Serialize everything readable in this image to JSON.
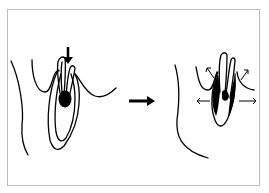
{
  "diagram": {
    "colors": {
      "stroke": "#000000",
      "fill_dark": "#000000",
      "background": "#ffffff",
      "frame": "#bdbdbd"
    },
    "panels": [
      {
        "id": "before",
        "force_arrow": "down",
        "dark_region": "apical lesion"
      },
      {
        "id": "after",
        "expansion_arrows": [
          "up-left",
          "up-right",
          "left",
          "right"
        ],
        "dark_region": "widened periodontal space"
      }
    ],
    "transition_arrow": "right"
  }
}
